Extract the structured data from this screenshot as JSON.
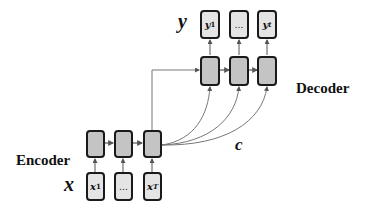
{
  "labels": {
    "encoder": "Encoder",
    "decoder": "Decoder",
    "input_symbol": "x",
    "output_symbol": "y",
    "context_symbol": "c"
  },
  "encoder": {
    "inputs": [
      "x1",
      "...",
      "xT"
    ],
    "inputs_display": [
      {
        "base": "x",
        "sub": "1"
      },
      {
        "base": "…",
        "sub": ""
      },
      {
        "base": "x",
        "sub": "T"
      }
    ],
    "hidden_count": 3
  },
  "decoder": {
    "outputs_display": [
      {
        "base": "y",
        "sub": "1"
      },
      {
        "base": "…",
        "sub": ""
      },
      {
        "base": "y",
        "sub": "t"
      }
    ],
    "hidden_count": 3
  },
  "colors": {
    "hidden_fill": "#c4c4c4",
    "io_fill": "#e4e4e4",
    "border": "#1a1a1a",
    "arrow": "#666666"
  }
}
